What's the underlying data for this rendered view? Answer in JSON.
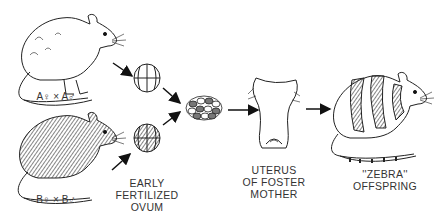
{
  "diagram": {
    "parents": [
      {
        "id": "A",
        "label": "A♀ × A♂",
        "coat": "white"
      },
      {
        "id": "B",
        "label": "B♀ × B♂",
        "coat": "dark"
      }
    ],
    "stages": {
      "ovum_label": "EARLY\nFERTILIZED\nOVUM",
      "uterus_label": "UTERUS\nOF FOSTER\nMOTHER",
      "offspring_label": "''ZEBRA''\nOFFSPRING"
    },
    "nodes": [
      "white-mouse-A",
      "dark-mouse-B",
      "ovum-A",
      "ovum-B",
      "fused-embryo",
      "uterus",
      "zebra-mouse"
    ],
    "edges": [
      [
        "white-mouse-A",
        "ovum-A"
      ],
      [
        "dark-mouse-B",
        "ovum-B"
      ],
      [
        "ovum-A",
        "fused-embryo"
      ],
      [
        "ovum-B",
        "fused-embryo"
      ],
      [
        "fused-embryo",
        "uterus"
      ],
      [
        "uterus",
        "zebra-mouse"
      ]
    ]
  }
}
